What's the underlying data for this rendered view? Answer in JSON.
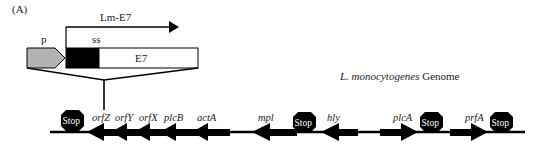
{
  "panel_label": "(A)",
  "construct": {
    "transcript_label": "Lm-E7",
    "promoter_label": "p",
    "signal_sequence_label": "ss",
    "insert_label": "E7",
    "colors": {
      "promoter_fill": "#b3b3b3",
      "signal_sequence_fill": "#000000",
      "insert_fill": "#ffffff",
      "line": "#000000"
    }
  },
  "genome": {
    "title_italic": "L. monocytogenes",
    "title_rest": " Genome",
    "stop_label": "Stop",
    "genes": [
      {
        "name": "orfZ",
        "direction": "left"
      },
      {
        "name": "orfY",
        "direction": "left"
      },
      {
        "name": "orfX",
        "direction": "left"
      },
      {
        "name": "plcB",
        "direction": "left"
      },
      {
        "name": "actA",
        "direction": "left"
      },
      {
        "name": "mpl",
        "direction": "left"
      },
      {
        "name": "hly",
        "direction": "left"
      },
      {
        "name": "plcA",
        "direction": "right"
      },
      {
        "name": "prfA",
        "direction": "right"
      }
    ],
    "stops": 4
  }
}
